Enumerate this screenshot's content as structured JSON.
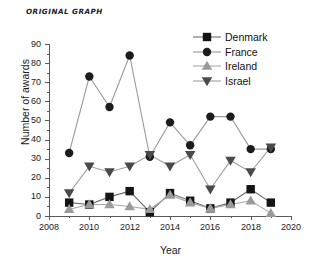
{
  "caption": "ORIGINAL GRAPH",
  "chart_data": {
    "type": "line",
    "title": "ORIGINAL GRAPH",
    "xlabel": "Year",
    "ylabel": "Number of awards",
    "x": [
      2009,
      2010,
      2011,
      2012,
      2013,
      2014,
      2015,
      2016,
      2017,
      2018,
      2019
    ],
    "xlim": [
      2008,
      2020
    ],
    "ylim": [
      0,
      90
    ],
    "xticks": [
      2008,
      2010,
      2012,
      2014,
      2016,
      2018,
      2020
    ],
    "xticks_minor": [
      2009,
      2011,
      2013,
      2015,
      2017,
      2019
    ],
    "yticks": [
      0,
      10,
      20,
      30,
      40,
      50,
      60,
      70,
      80,
      90
    ],
    "grid": false,
    "legend_position": "top-right",
    "series": [
      {
        "name": "Denmark",
        "marker": "square",
        "color": "#141414",
        "line_color": "#6e6e6e",
        "values": [
          7,
          6,
          10,
          13,
          2,
          12,
          8,
          4,
          7,
          14,
          7
        ]
      },
      {
        "name": "France",
        "marker": "circle",
        "color": "#1c1c1c",
        "line_color": "#9a9a9a",
        "values": [
          33,
          73,
          57,
          84,
          31,
          49,
          37,
          52,
          52,
          35,
          35
        ]
      },
      {
        "name": "Ireland",
        "marker": "triangle-up",
        "color": "#9b9b9b",
        "line_color": "#a8a8a8",
        "values": [
          3.5,
          6,
          6,
          5,
          3.5,
          11,
          7,
          4,
          6,
          8,
          1.5
        ]
      },
      {
        "name": "Israel",
        "marker": "triangle-down",
        "color": "#4a4a4a",
        "line_color": "#a0a0a0",
        "values": [
          12,
          26,
          23,
          26,
          32,
          26,
          32,
          14,
          29,
          23,
          36
        ]
      }
    ]
  },
  "axis": {
    "y_tick_labels": [
      "0",
      "10",
      "20",
      "30",
      "40",
      "50",
      "60",
      "70",
      "80",
      "90"
    ],
    "x_tick_labels": [
      "2008",
      "2010",
      "2012",
      "2014",
      "2016",
      "2018",
      "2020"
    ],
    "x_title": "Year",
    "y_title": "Number of awards"
  },
  "legend": {
    "items": [
      {
        "label": "Denmark"
      },
      {
        "label": "France"
      },
      {
        "label": "Ireland"
      },
      {
        "label": "Israel"
      }
    ]
  }
}
